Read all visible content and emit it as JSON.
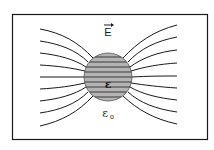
{
  "diagram": {
    "labels": {
      "field": "E",
      "sphere_permittivity": "ε",
      "medium_permittivity": "ε",
      "medium_subscript": "o"
    },
    "colors": {
      "line": "#1a1a1a",
      "sphere_fill": "#b4b4b4",
      "frame": "#1a1a1a",
      "background": "#ffffff"
    },
    "frame": {
      "x": 12,
      "y": 14,
      "width": 195,
      "height": 125
    },
    "sphere": {
      "cx": 108,
      "cy": 77,
      "r": 24
    },
    "field_lines": {
      "count": 9,
      "left_start_y": [
        29,
        41,
        53,
        65,
        77,
        89,
        101,
        113,
        126
      ],
      "right_end_y": [
        25,
        37,
        50,
        63,
        76,
        88,
        100,
        112,
        124
      ]
    }
  }
}
